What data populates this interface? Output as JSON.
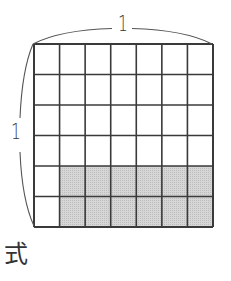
{
  "labels": {
    "top_length": "1",
    "left_length": "1",
    "expression_prefix": "式"
  },
  "grid": {
    "columns": 7,
    "rows": 6,
    "origin_x": 34,
    "origin_y": 44,
    "cell_width": 25.57,
    "cell_height": 30.5,
    "shaded_rows": [
      4,
      5
    ],
    "shaded_columns": [
      1,
      2,
      3,
      4,
      5,
      6
    ],
    "shaded_cell_count": 12,
    "total_cell_count": 42
  },
  "colors": {
    "line": "#3a3a3a",
    "shade": "#d2d2d2",
    "shade_dot": "#b8b8b8",
    "brace": "#555555",
    "background": "#ffffff"
  }
}
